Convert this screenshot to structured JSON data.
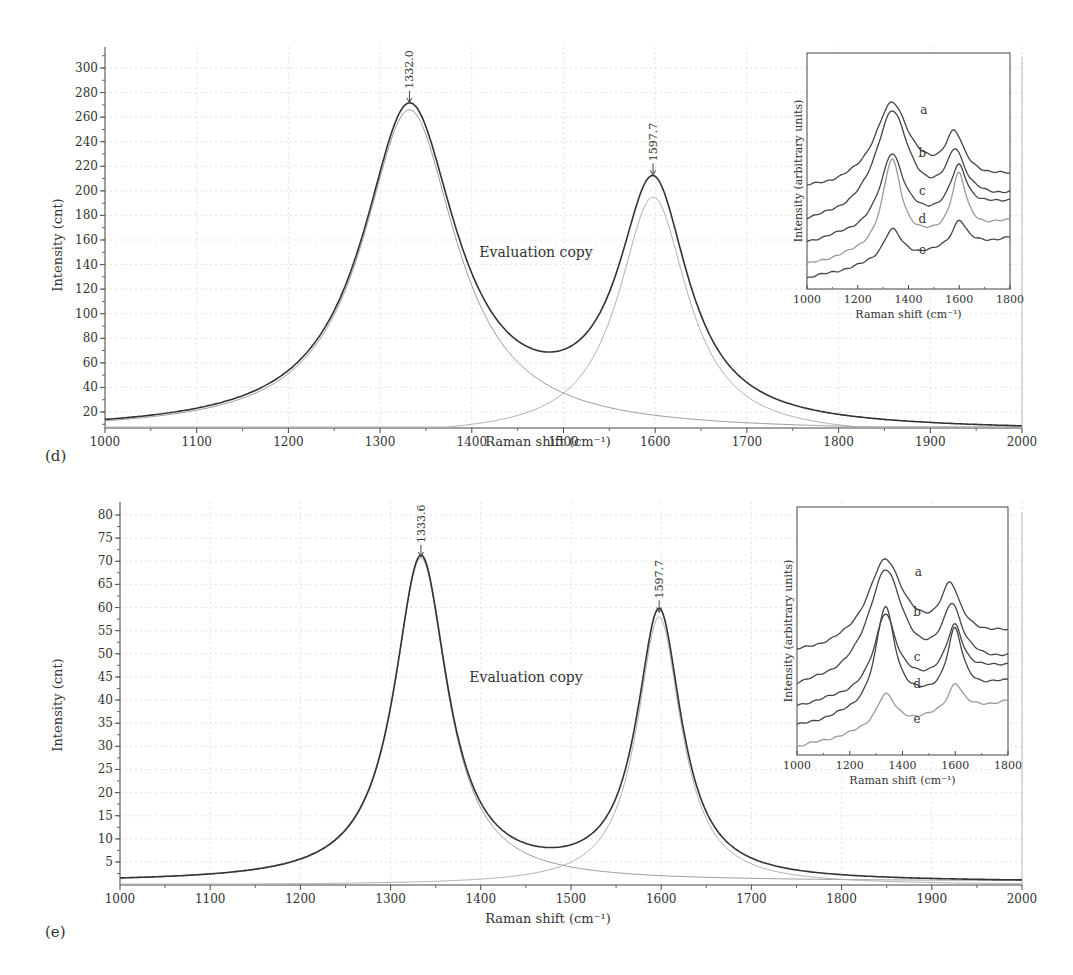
{
  "figure": {
    "panels": [
      {
        "label": "(d)",
        "watermark": "Evaluation copy",
        "xlabel": "Raman shift (cm⁻¹)",
        "ylabel": "Intensity (cnt)",
        "peak_labels": [
          "1332.0",
          "1597.7"
        ],
        "inset": {
          "xlabel": "Raman shift (cm⁻¹)",
          "ylabel": "Intensity (arbitrary units)",
          "curve_labels": [
            "a",
            "b",
            "c",
            "d",
            "e"
          ],
          "xticks": [
            "1000",
            "1200",
            "1400",
            "1600",
            "1800"
          ]
        }
      },
      {
        "label": "(e)",
        "watermark": "Evaluation copy",
        "xlabel": "Raman shift (cm⁻¹)",
        "ylabel": "Intensity (cnt)",
        "peak_labels": [
          "1333.6",
          "1597.7"
        ],
        "inset": {
          "xlabel": "Raman shift (cm⁻¹)",
          "ylabel": "Intensity (arbitrary units)",
          "curve_labels": [
            "a",
            "b",
            "c",
            "d",
            "e"
          ],
          "xticks": [
            "1000",
            "1200",
            "1400",
            "1600",
            "1800"
          ]
        }
      }
    ]
  },
  "chart_data": [
    {
      "type": "line",
      "panel": "(d)",
      "title": "",
      "xlabel": "Raman shift (cm-1)",
      "ylabel": "Intensity (cnt)",
      "xlim": [
        1000,
        2000
      ],
      "ylim": [
        7,
        315
      ],
      "xticks": [
        1000,
        1100,
        1200,
        1300,
        1400,
        1500,
        1600,
        1700,
        1800,
        1900,
        2000
      ],
      "yticks": [
        20,
        40,
        60,
        80,
        100,
        120,
        140,
        160,
        180,
        200,
        220,
        240,
        260,
        280,
        300
      ],
      "grid": true,
      "annotations": [
        {
          "text": "1332.0",
          "x": 1332.0,
          "y": 270
        },
        {
          "text": "1597.7",
          "x": 1597.7,
          "y": 211
        },
        {
          "text": "Evaluation copy",
          "x": 1470,
          "y": 152
        }
      ],
      "series": [
        {
          "name": "Measured spectrum",
          "role": "data",
          "x": [
            1000,
            1100,
            1200,
            1250,
            1300,
            1332,
            1360,
            1400,
            1450,
            1480,
            1520,
            1560,
            1597.7,
            1630,
            1700,
            1800,
            1900,
            2000
          ],
          "y": [
            11,
            25,
            60,
            115,
            230,
            270,
            240,
            160,
            100,
            82,
            100,
            160,
            211,
            170,
            70,
            25,
            14,
            9
          ]
        },
        {
          "name": "D band fit (Lorentzian)",
          "role": "fit",
          "peak_center": 1332.0,
          "peak_height": 262,
          "x": [
            1000,
            1100,
            1200,
            1300,
            1332,
            1400,
            1500,
            1600,
            1700,
            1800,
            1900,
            2000
          ],
          "y": [
            10,
            24,
            58,
            225,
            262,
            150,
            42,
            17,
            9,
            6,
            5,
            4
          ]
        },
        {
          "name": "G band fit (Lorentzian)",
          "role": "fit",
          "peak_center": 1597.7,
          "peak_height": 195,
          "x": [
            1200,
            1300,
            1400,
            1500,
            1550,
            1597.7,
            1650,
            1700,
            1800,
            1900,
            2000
          ],
          "y": [
            3,
            6,
            15,
            60,
            130,
            195,
            130,
            60,
            18,
            9,
            5
          ]
        }
      ],
      "inset": {
        "type": "line",
        "xlabel": "Raman shift (cm-1)",
        "ylabel": "Intensity (arbitrary units)",
        "xlim": [
          1000,
          1800
        ],
        "xticks": [
          1000,
          1200,
          1400,
          1600,
          1800
        ],
        "series_labels": [
          "a",
          "b",
          "c",
          "d",
          "e"
        ],
        "note": "Vertically offset spectra, D band ~1340 and G band ~1590"
      }
    },
    {
      "type": "line",
      "panel": "(e)",
      "title": "",
      "xlabel": "Raman shift (cm-1)",
      "ylabel": "Intensity (cnt)",
      "xlim": [
        1000,
        2000
      ],
      "ylim": [
        0,
        82
      ],
      "xticks": [
        1000,
        1100,
        1200,
        1300,
        1400,
        1500,
        1600,
        1700,
        1800,
        1900,
        2000
      ],
      "yticks": [
        5,
        10,
        15,
        20,
        25,
        30,
        35,
        40,
        45,
        50,
        55,
        60,
        65,
        70,
        75,
        80
      ],
      "grid": true,
      "annotations": [
        {
          "text": "1333.6",
          "x": 1333.6,
          "y": 70.5
        },
        {
          "text": "1597.7",
          "x": 1597.7,
          "y": 58.5
        },
        {
          "text": "Evaluation copy",
          "x": 1470,
          "y": 37
        }
      ],
      "series": [
        {
          "name": "Measured spectrum",
          "role": "data",
          "x": [
            1000,
            1100,
            1200,
            1250,
            1300,
            1333.6,
            1370,
            1400,
            1450,
            1475,
            1520,
            1560,
            1597.7,
            1630,
            1700,
            1800,
            1900,
            2000
          ],
          "y": [
            1.2,
            2.2,
            5,
            12,
            42,
            70.5,
            45,
            20,
            10,
            8,
            12,
            32,
            58.5,
            40,
            9,
            2.5,
            1.5,
            1
          ]
        },
        {
          "name": "D band fit (Lorentzian)",
          "role": "fit",
          "peak_center": 1333.6,
          "peak_height": 70,
          "x": [
            1000,
            1100,
            1200,
            1300,
            1333.6,
            1400,
            1500,
            1600,
            1700,
            1800,
            1900,
            2000
          ],
          "y": [
            1,
            2,
            4.8,
            40,
            70,
            18,
            4,
            1.8,
            1,
            0.7,
            0.5,
            0.4
          ]
        },
        {
          "name": "G band fit (Lorentzian)",
          "role": "fit",
          "peak_center": 1597.7,
          "peak_height": 58,
          "x": [
            1200,
            1300,
            1400,
            1500,
            1550,
            1597.7,
            1650,
            1700,
            1800,
            1900,
            2000
          ],
          "y": [
            0.4,
            0.8,
            2,
            7,
            20,
            58,
            22,
            8,
            2.2,
            1,
            0.7
          ]
        }
      ],
      "inset": {
        "type": "line",
        "xlabel": "Raman shift (cm-1)",
        "ylabel": "Intensity (arbitrary units)",
        "xlim": [
          1000,
          1800
        ],
        "xticks": [
          1000,
          1200,
          1400,
          1600,
          1800
        ],
        "series_labels": [
          "a",
          "b",
          "c",
          "d",
          "e"
        ],
        "note": "Vertically offset spectra, D band ~1335 and G band ~1595"
      }
    }
  ]
}
